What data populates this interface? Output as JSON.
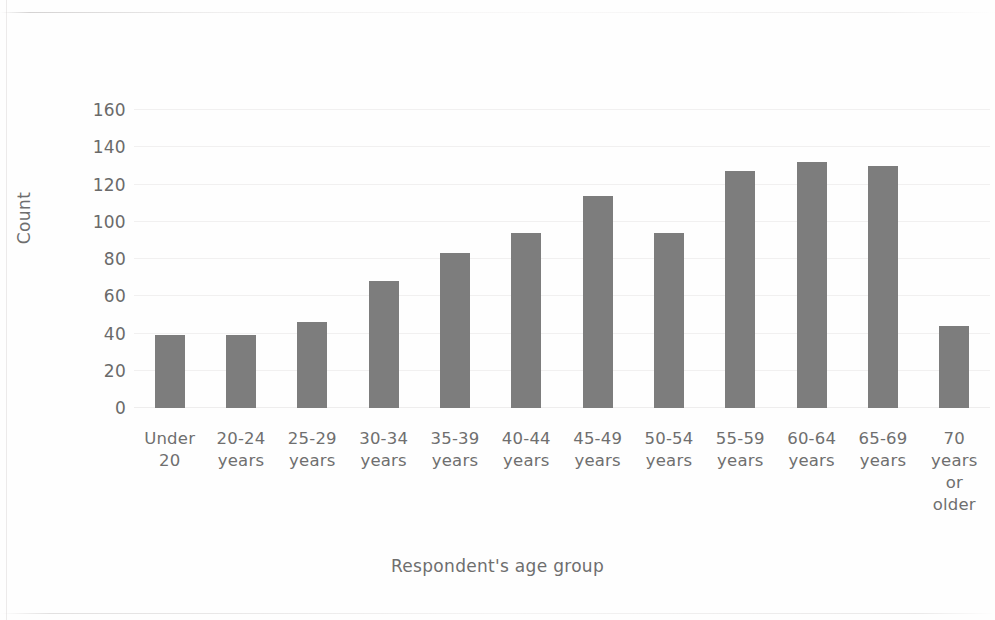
{
  "chart_data": {
    "type": "bar",
    "title": "",
    "xlabel": "Respondent's age group",
    "ylabel": "Count",
    "categories": [
      "Under 20",
      "20-24 years",
      "25-29 years",
      "30-34 years",
      "35-39 years",
      "40-44 years",
      "45-49 years",
      "50-54 years",
      "55-59 years",
      "60-64 years",
      "65-69 years",
      "70 years or older"
    ],
    "category_lines": [
      [
        "Under",
        "20"
      ],
      [
        "20-24",
        "years"
      ],
      [
        "25-29",
        "years"
      ],
      [
        "30-34",
        "years"
      ],
      [
        "35-39",
        "years"
      ],
      [
        "40-44",
        "years"
      ],
      [
        "45-49",
        "years"
      ],
      [
        "50-54",
        "years"
      ],
      [
        "55-59",
        "years"
      ],
      [
        "60-64",
        "years"
      ],
      [
        "65-69",
        "years"
      ],
      [
        "70",
        "years",
        "or",
        "older"
      ]
    ],
    "values": [
      39,
      39,
      46,
      68,
      83,
      94,
      114,
      94,
      127,
      132,
      130,
      44
    ],
    "ylim": [
      0,
      160
    ],
    "yticks": [
      0,
      20,
      40,
      60,
      80,
      100,
      120,
      140,
      160
    ],
    "ytick_labels": [
      "0",
      "20",
      "40",
      "60",
      "80",
      "100",
      "120",
      "140",
      "160"
    ],
    "grid": true,
    "grid_axis": "y",
    "legend": "none",
    "bar_color": "#7d7d7d",
    "text_color": "#6e6e6e",
    "gridline_color": "#f1f0f0",
    "background_color": "#fefefe"
  }
}
